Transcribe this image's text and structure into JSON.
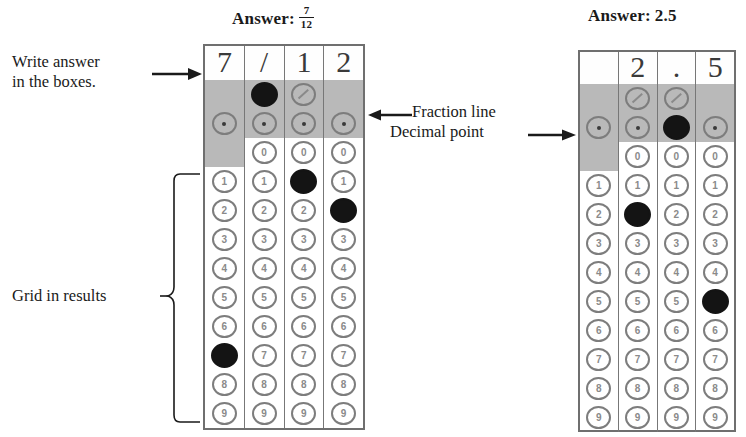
{
  "annotations": {
    "write_answer": "Write answer\nin the boxes.",
    "write_answer_line1": "Write answer",
    "write_answer_line2": "in the boxes.",
    "fraction_line": "Fraction line",
    "decimal_point": "Decimal point",
    "grid_in_results": "Grid in results"
  },
  "icons": {
    "arrow_right": "arrow-right-icon",
    "arrow_left": "arrow-left-icon",
    "bracket": "curly-bracket-icon"
  },
  "colors": {
    "filled_bubble": "#141414",
    "empty_bubble": "#7d7d7d",
    "shaded_row": "#b9b9b9",
    "grid_border": "#6f6f6f",
    "text": "#1a1a1a"
  },
  "grids": [
    {
      "id": "fraction-grid",
      "title_label": "Answer:",
      "title_value_type": "fraction",
      "title_numerator": "7",
      "title_denominator": "12",
      "answer_text": "7/12",
      "handwritten": [
        "7",
        "/",
        "1",
        "2"
      ],
      "row_labels": [
        "/",
        ".",
        "0",
        "1",
        "2",
        "3",
        "4",
        "5",
        "6",
        "7",
        "8",
        "9"
      ],
      "columns": [
        {
          "index": 1,
          "has_fraction_bubble": false,
          "has_decimal_bubble": true,
          "has_zero_bubble": false,
          "filled": "7"
        },
        {
          "index": 2,
          "has_fraction_bubble": true,
          "has_decimal_bubble": true,
          "has_zero_bubble": true,
          "filled": "/"
        },
        {
          "index": 3,
          "has_fraction_bubble": true,
          "has_decimal_bubble": true,
          "has_zero_bubble": true,
          "filled": "1"
        },
        {
          "index": 4,
          "has_fraction_bubble": false,
          "has_decimal_bubble": true,
          "has_zero_bubble": true,
          "filled": "2"
        }
      ]
    },
    {
      "id": "decimal-grid",
      "title_label": "Answer:",
      "title_value_type": "plain",
      "title_value": "2.5",
      "answer_text": "2.5",
      "handwritten": [
        "",
        "2",
        ".",
        "5"
      ],
      "row_labels": [
        "/",
        ".",
        "0",
        "1",
        "2",
        "3",
        "4",
        "5",
        "6",
        "7",
        "8",
        "9"
      ],
      "columns": [
        {
          "index": 1,
          "has_fraction_bubble": false,
          "has_decimal_bubble": true,
          "has_zero_bubble": false,
          "filled": ""
        },
        {
          "index": 2,
          "has_fraction_bubble": true,
          "has_decimal_bubble": true,
          "has_zero_bubble": true,
          "filled": "2"
        },
        {
          "index": 3,
          "has_fraction_bubble": true,
          "has_decimal_bubble": true,
          "has_zero_bubble": true,
          "filled": "."
        },
        {
          "index": 4,
          "has_fraction_bubble": false,
          "has_decimal_bubble": true,
          "has_zero_bubble": true,
          "filled": "5"
        }
      ]
    }
  ]
}
